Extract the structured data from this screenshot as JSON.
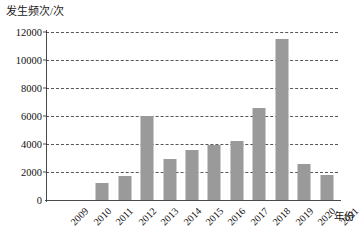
{
  "chart_data": {
    "type": "bar",
    "title": "",
    "xlabel": "年份",
    "ylabel": "发生频次/次",
    "categories": [
      "2009",
      "2010",
      "2011",
      "2012",
      "2013",
      "2014",
      "2015",
      "2016",
      "2017",
      "2018",
      "2019",
      "2020",
      "2021"
    ],
    "values": [
      0,
      0,
      1200,
      1700,
      6000,
      2900,
      3550,
      3950,
      4200,
      6600,
      11500,
      2550,
      1800
    ],
    "ylim": [
      0,
      12000
    ],
    "yticks": [
      "0",
      "2000",
      "4000",
      "6000",
      "8000",
      "10000",
      "12000"
    ],
    "ytick_values": [
      0,
      2000,
      4000,
      6000,
      8000,
      10000,
      12000
    ],
    "grid": "horizontal-dashed",
    "legend": "none",
    "bar_color": "#9a9a9a",
    "axis_color": "#4a4a4a",
    "grid_color": "#3a3a3a",
    "background": "#ffffff"
  }
}
